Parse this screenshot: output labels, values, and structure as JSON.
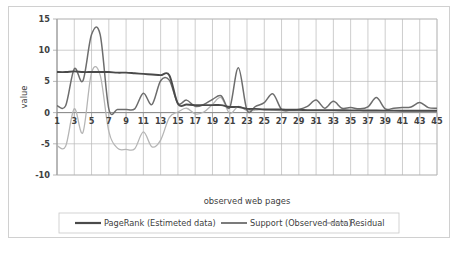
{
  "chart_data": {
    "type": "line",
    "title": "",
    "xlabel": "observed web pages",
    "ylabel": "value",
    "xlim": [
      1,
      45
    ],
    "ylim": [
      -10,
      15
    ],
    "yticks": [
      15,
      10,
      5,
      0,
      -5,
      -10
    ],
    "xticks": [
      1,
      3,
      5,
      7,
      9,
      11,
      13,
      15,
      17,
      19,
      21,
      23,
      25,
      27,
      29,
      31,
      33,
      35,
      37,
      39,
      41,
      43,
      45
    ],
    "grid": true,
    "legend_position": "bottom",
    "x": [
      1,
      2,
      3,
      4,
      5,
      6,
      7,
      8,
      9,
      10,
      11,
      12,
      13,
      14,
      15,
      16,
      17,
      18,
      19,
      20,
      21,
      22,
      23,
      24,
      25,
      26,
      27,
      28,
      29,
      30,
      31,
      32,
      33,
      34,
      35,
      36,
      37,
      38,
      39,
      40,
      41,
      42,
      43,
      44,
      45
    ],
    "series": [
      {
        "name": "PageRank (Estimeted data)",
        "color": "#4a4a4a",
        "width": 1.9,
        "values": [
          6.5,
          6.5,
          6.6,
          6.5,
          6.5,
          6.5,
          6.5,
          6.4,
          6.4,
          6.3,
          6.2,
          6.1,
          6.0,
          6.0,
          1.4,
          1.3,
          1.2,
          1.2,
          1.2,
          1.2,
          0.9,
          0.9,
          0.6,
          0.6,
          0.5,
          0.5,
          0.5,
          0.45,
          0.45,
          0.4,
          0.4,
          0.4,
          0.4,
          0.38,
          0.36,
          0.35,
          0.34,
          0.33,
          0.32,
          0.31,
          0.3,
          0.3,
          0.3,
          0.3,
          0.3
        ]
      },
      {
        "name": "Support (Observed data)",
        "color": "#6d6d6d",
        "width": 1.5,
        "values": [
          1.1,
          1.1,
          7.0,
          5.1,
          12.5,
          12.5,
          0.6,
          0.5,
          0.5,
          0.6,
          3.1,
          1.3,
          5.1,
          5.2,
          1.5,
          2.0,
          1.0,
          1.3,
          2.1,
          2.7,
          0.8,
          7.2,
          0.4,
          1.0,
          1.6,
          3.0,
          0.5,
          0.4,
          0.5,
          1.0,
          2.0,
          0.7,
          1.8,
          0.7,
          0.8,
          0.6,
          0.9,
          2.4,
          0.6,
          0.7,
          0.8,
          0.9,
          1.6,
          0.8,
          0.7
        ]
      },
      {
        "name": "Residual",
        "color": "#b5b5b5",
        "width": 1.3,
        "values": [
          -5.3,
          -5.4,
          0.6,
          -3.2,
          6.4,
          6.0,
          -3.0,
          -5.7,
          -5.9,
          -5.8,
          -3.1,
          -5.5,
          -4.4,
          -0.8,
          0.1,
          0.7,
          -0.2,
          0.1,
          1.3,
          2.4,
          -0.1,
          1.0,
          0.3,
          0.4,
          0.5,
          0.4,
          0.3,
          0.3,
          0.3,
          0.3,
          0.3,
          0.3,
          0.3,
          0.3,
          0.3,
          0.3,
          0.3,
          0.3,
          0.3,
          0.3,
          0.3,
          0.3,
          0.3,
          0.3,
          0.3
        ]
      }
    ]
  },
  "legend": {
    "items": [
      {
        "label": "PageRank (Estimeted data)"
      },
      {
        "label": "Support (Observed data)"
      },
      {
        "label": "Residual"
      }
    ]
  },
  "axes": {
    "y_title": "value",
    "x_title": "observed web pages",
    "y_ticks": [
      "15",
      "10",
      "5",
      "0",
      "-5",
      "-10"
    ],
    "x_ticks": [
      "1",
      "3",
      "5",
      "7",
      "9",
      "11",
      "13",
      "15",
      "17",
      "19",
      "21",
      "23",
      "25",
      "27",
      "29",
      "31",
      "33",
      "35",
      "37",
      "39",
      "41",
      "43",
      "45"
    ]
  },
  "colors": {
    "pagerank": "#4a4a4a",
    "support": "#6d6d6d",
    "residual": "#b5b5b5",
    "grid": "#b8b8b8",
    "frame": "#d0d0d0"
  }
}
